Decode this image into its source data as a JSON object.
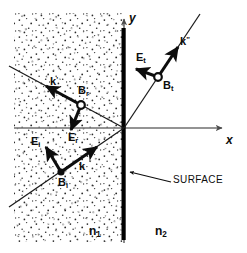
{
  "figure": {
    "colors": {
      "ink": "#0d0d0d",
      "axis": "#6f6f6f",
      "ray": "#1a1a1a",
      "surface": "#000000",
      "stipple": "#2b2b2b",
      "background": "#ffffff"
    }
  },
  "axes": {
    "y_label": "y",
    "x_label": "x",
    "origin": {
      "x": 124,
      "y": 128
    }
  },
  "surface": {
    "label": "SURFACE",
    "x": 124,
    "y_top": 28,
    "y_bottom": 240
  },
  "media": {
    "left": {
      "label_n": "n",
      "label_sub": "1",
      "region": "stippled"
    },
    "right": {
      "label_n": "n",
      "label_sub": "2",
      "region": "clear"
    }
  },
  "waves": [
    {
      "name": "incident",
      "k_label": "k",
      "k_sup": "",
      "e_label": "E",
      "e_sub": "i",
      "b_label": "B",
      "b_sub": "i",
      "direction": "up-right toward origin",
      "quadrant": "lower-left"
    },
    {
      "name": "reflected",
      "k_label": "k",
      "k_sup": "'",
      "e_label": "E",
      "e_sub": "r",
      "b_label": "B",
      "b_sub": "r",
      "direction": "up-left away from origin",
      "quadrant": "upper-left"
    },
    {
      "name": "transmitted",
      "k_label": "k",
      "k_sup": "\"",
      "e_label": "E",
      "e_sub": "t",
      "b_label": "B",
      "b_sub": "t",
      "direction": "up-right away from origin",
      "quadrant": "upper-right"
    }
  ]
}
